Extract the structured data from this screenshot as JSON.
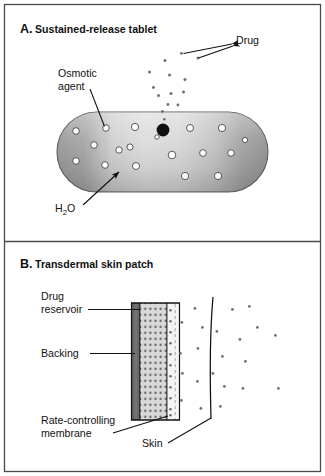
{
  "figure": {
    "background_color": "#ffffff",
    "border_color": "#4a4a4a",
    "ink_color": "#111111"
  },
  "panels": [
    {
      "id": "panel-a",
      "letter": "A.",
      "title": "Sustained-release tablet",
      "labels": [
        {
          "name": "drug",
          "text": "Drug"
        },
        {
          "name": "osmotic-agent-line1",
          "text": "Osmotic"
        },
        {
          "name": "osmotic-agent-line2",
          "text": "agent"
        },
        {
          "name": "water",
          "text_parts": [
            "H",
            "2",
            "O"
          ],
          "text": "H2O"
        }
      ],
      "tablet": {
        "fill_left": "#9a9a9a",
        "fill_mid": "#d5d5d5",
        "fill_right": "#9a9a9a",
        "stroke": "#555555",
        "orifice_color": "#111111",
        "osmotic_particle_fill": "#ffffff",
        "osmotic_particle_stroke": "#444444",
        "osmotic_particle_count": 18,
        "drug_particle_color": "#6f6f6f",
        "released_drug_particle_count": 14
      }
    },
    {
      "id": "panel-b",
      "letter": "B.",
      "title": "Transdermal skin  patch",
      "labels": [
        {
          "name": "drug-reservoir-line1",
          "text": "Drug"
        },
        {
          "name": "drug-reservoir-line2",
          "text": "reservoir"
        },
        {
          "name": "backing",
          "text": "Backing"
        },
        {
          "name": "rate-controlling-line1",
          "text": "Rate-controlling"
        },
        {
          "name": "rate-controlling-line2",
          "text": "membrane"
        },
        {
          "name": "skin",
          "text": "Skin"
        }
      ],
      "patch": {
        "backing_fill": "#6b6b6b",
        "reservoir_fill": "#d9d9d9",
        "reservoir_dot_color": "#707070",
        "membrane_fill": "#f2f2f2",
        "membrane_dash_color": "#8a8a8a",
        "outline": "#111111",
        "reservoir_dot_rows": 17,
        "reservoir_dot_cols": 5,
        "membrane_dot_count": 11
      },
      "skin_line": {
        "stroke": "#111111",
        "curved": true
      },
      "diffused_particle_color": "#6f6f6f",
      "diffused_particle_count": 22
    }
  ]
}
